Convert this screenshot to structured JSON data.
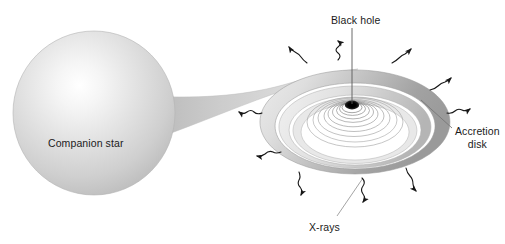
{
  "diagram": {
    "type": "astronomy-schematic",
    "background_color": "#ffffff",
    "labels": {
      "black_hole": "Black hole",
      "companion_star": "Companion star",
      "accretion_disk_line1": "Accretion",
      "accretion_disk_line2": "disk",
      "xrays": "X-rays"
    },
    "colors": {
      "text": "#1b1b1b",
      "star_highlight": "#ffffff",
      "star_mid": "#dcdcdc",
      "star_edge": "#a9a9a9",
      "disk_dark": "#a3a3a3",
      "disk_mid": "#c9c9c9",
      "disk_light": "#efefef",
      "black_hole": "#000000",
      "leader_line": "#8c8c8c",
      "arrow": "#1a1a1a"
    },
    "elements": {
      "companion_star": {
        "name": "companion-star",
        "center_x": 94,
        "center_y": 113,
        "radius_x": 81,
        "radius_y": 82,
        "highlight_x": 78,
        "highlight_y": 92
      },
      "black_hole": {
        "name": "black-hole",
        "center_x": 352,
        "center_y": 105,
        "radius_x": 7,
        "radius_y": 4.2
      },
      "accretion_disk": {
        "name": "accretion-disk",
        "center_x": 355,
        "center_y": 122,
        "outer_radius_x": 95,
        "outer_radius_y": 52,
        "ring_count": 12
      },
      "accretion_stream": {
        "name": "accretion-stream",
        "from": "companion-star",
        "to": "accretion-disk"
      },
      "jet_leader": {
        "name": "black-hole-leader-line",
        "x": 352,
        "y_top": 28,
        "y_bottom": 104
      }
    },
    "xray_arrows": [
      {
        "id": "xray-arrow-top-left",
        "x": 298,
        "y": 52,
        "angle": 222
      },
      {
        "id": "xray-arrow-top-center",
        "x": 338,
        "y": 46,
        "angle": 270
      },
      {
        "id": "xray-arrow-top-right",
        "x": 404,
        "y": 52,
        "angle": 315
      },
      {
        "id": "xray-arrow-right-upper",
        "x": 443,
        "y": 80,
        "angle": 330
      },
      {
        "id": "xray-arrow-right-lower",
        "x": 458,
        "y": 105,
        "angle": 355
      },
      {
        "id": "xray-arrow-left-upper",
        "x": 243,
        "y": 113,
        "angle": 180
      },
      {
        "id": "xray-arrow-left-lower",
        "x": 262,
        "y": 155,
        "angle": 190
      },
      {
        "id": "xray-arrow-bottom-left",
        "x": 307,
        "y": 190,
        "angle": 110
      },
      {
        "id": "xray-arrow-bottom-center",
        "x": 357,
        "y": 196,
        "angle": 95
      },
      {
        "id": "xray-arrow-bottom-right",
        "x": 412,
        "y": 188,
        "angle": 70
      }
    ],
    "leader_lines": [
      {
        "id": "leader-accretion-disk",
        "x1": 452,
        "y1": 128,
        "x2": 421,
        "y2": 100
      },
      {
        "id": "leader-xrays",
        "x1": 337,
        "y1": 216,
        "x2": 363,
        "y2": 178
      }
    ]
  }
}
